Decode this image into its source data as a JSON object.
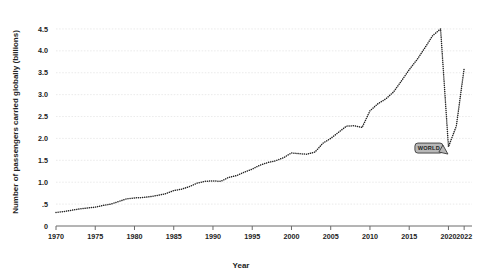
{
  "chart_data": {
    "type": "line",
    "title": "",
    "subtitle": "",
    "xlabel": "Year",
    "ylabel": "Number of passengers carried globally (billions)",
    "xlim": [
      1970,
      2023
    ],
    "ylim": [
      0,
      4.75
    ],
    "grid": true,
    "grid_axis": "y",
    "legend": "none",
    "line_style": "dotted",
    "marker": "dot",
    "color": "#222222",
    "x_ticks": [
      "1970",
      "1975",
      "1980",
      "1985",
      "1990",
      "1995",
      "2000",
      "2005",
      "2010",
      "2015",
      "2020",
      "2022"
    ],
    "x_tick_values": [
      1970,
      1975,
      1980,
      1985,
      1990,
      1995,
      2000,
      2005,
      2010,
      2015,
      2020,
      2022
    ],
    "y_ticks": [
      "0",
      ".5",
      "1.0",
      "1.5",
      "2.0",
      "2.5",
      "3.0",
      "3.5",
      "4.0",
      "4.5"
    ],
    "y_tick_values": [
      0,
      0.5,
      1.0,
      1.5,
      2.0,
      2.5,
      3.0,
      3.5,
      4.0,
      4.5
    ],
    "annotations": [
      {
        "label": "WORLD",
        "x": 2019.55,
        "y": 1.78,
        "box_fill": "#b8b8b8",
        "box_stroke": "#3a3a3a",
        "text_color": "#1f1f1f"
      }
    ],
    "series": [
      {
        "name": "WORLD",
        "x": [
          1970,
          1971,
          1972,
          1973,
          1974,
          1975,
          1976,
          1977,
          1978,
          1979,
          1980,
          1981,
          1982,
          1983,
          1984,
          1985,
          1986,
          1987,
          1988,
          1989,
          1990,
          1991,
          1992,
          1993,
          1994,
          1995,
          1996,
          1997,
          1998,
          1999,
          2000,
          2001,
          2002,
          2003,
          2004,
          2005,
          2006,
          2007,
          2008,
          2009,
          2010,
          2011,
          2012,
          2013,
          2014,
          2015,
          2016,
          2017,
          2018,
          2019,
          2020,
          2021,
          2022
        ],
        "values": [
          0.31,
          0.33,
          0.36,
          0.39,
          0.41,
          0.43,
          0.47,
          0.5,
          0.56,
          0.62,
          0.64,
          0.65,
          0.67,
          0.7,
          0.74,
          0.81,
          0.84,
          0.9,
          0.98,
          1.02,
          1.03,
          1.02,
          1.11,
          1.15,
          1.23,
          1.3,
          1.39,
          1.45,
          1.49,
          1.56,
          1.67,
          1.65,
          1.64,
          1.69,
          1.89,
          2.0,
          2.14,
          2.28,
          2.29,
          2.25,
          2.63,
          2.79,
          2.9,
          3.06,
          3.31,
          3.57,
          3.8,
          4.07,
          4.35,
          4.5,
          1.81,
          2.28,
          3.6
        ]
      }
    ]
  },
  "axis": {
    "x_title": "Year",
    "y_title": "Number of passengers carried globally (billions)"
  }
}
